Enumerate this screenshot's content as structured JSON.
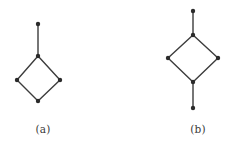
{
  "figure": {
    "background_color": "#ffffff",
    "edge_color": "#3c3c3c",
    "vertex_color": "#2b2b2b",
    "edge_width": 1.4,
    "vertex_radius": 2.2,
    "subfigures": [
      {
        "id": "a",
        "caption": "(a)",
        "description": "diamond graph with one pendant vertex attached to the top vertex",
        "graph_data": {
          "type": "graph",
          "vertex_count": 5,
          "edge_count": 5,
          "vertices": [
            {
              "name": "pendant-top",
              "x": 38,
              "y": 24
            },
            {
              "name": "diamond-top",
              "x": 38,
              "y": 56
            },
            {
              "name": "diamond-left",
              "x": 17,
              "y": 80
            },
            {
              "name": "diamond-right",
              "x": 60,
              "y": 80
            },
            {
              "name": "diamond-bottom",
              "x": 38,
              "y": 101
            }
          ],
          "edges": [
            {
              "from": "pendant-top",
              "to": "diamond-top"
            },
            {
              "from": "diamond-top",
              "to": "diamond-left"
            },
            {
              "from": "diamond-top",
              "to": "diamond-right"
            },
            {
              "from": "diamond-left",
              "to": "diamond-bottom"
            },
            {
              "from": "diamond-right",
              "to": "diamond-bottom"
            }
          ]
        }
      },
      {
        "id": "b",
        "caption": "(b)",
        "description": "diamond graph with pendant vertices attached to the top and bottom vertices",
        "graph_data": {
          "type": "graph",
          "vertex_count": 6,
          "edge_count": 6,
          "vertices": [
            {
              "name": "pendant-top",
              "x": 193,
              "y": 11
            },
            {
              "name": "diamond-top",
              "x": 193,
              "y": 35
            },
            {
              "name": "diamond-left",
              "x": 168,
              "y": 58
            },
            {
              "name": "diamond-right",
              "x": 218,
              "y": 58
            },
            {
              "name": "diamond-bottom",
              "x": 193,
              "y": 82
            },
            {
              "name": "pendant-bottom",
              "x": 193,
              "y": 108
            }
          ],
          "edges": [
            {
              "from": "pendant-top",
              "to": "diamond-top"
            },
            {
              "from": "diamond-top",
              "to": "diamond-left"
            },
            {
              "from": "diamond-top",
              "to": "diamond-right"
            },
            {
              "from": "diamond-left",
              "to": "diamond-bottom"
            },
            {
              "from": "diamond-right",
              "to": "diamond-bottom"
            },
            {
              "from": "diamond-bottom",
              "to": "pendant-bottom"
            }
          ]
        }
      }
    ]
  }
}
